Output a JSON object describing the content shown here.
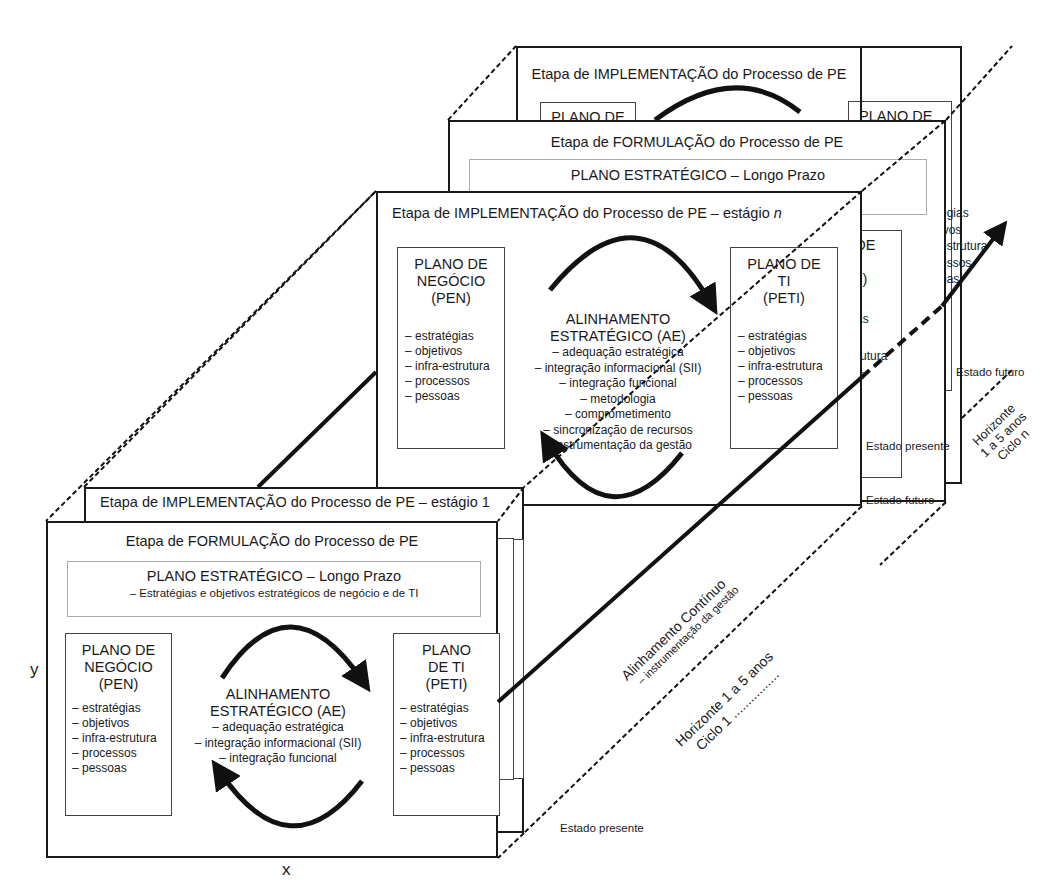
{
  "diagram": {
    "axes": {
      "x_label": "x",
      "y_label": "y"
    },
    "back_cycle": {
      "implementation": {
        "title": "Etapa de IMPLEMENTAÇÃO do Processo de PE",
        "left_plan_partial": "PLANO DE",
        "right_plan_lines": [
          "PLANO DE",
          "TI",
          "(PETI)"
        ],
        "right_list_partial": [
          "égias",
          "ivos",
          "estrutura",
          "essos",
          "oas"
        ]
      },
      "formulation": {
        "title": "Etapa de FORMULAÇÃO do Processo de PE",
        "strategic_plan_title": "PLANO ESTRATÉGICO – Longo Prazo",
        "right_plan_partial": [
          "O DE",
          "TI",
          "ETI)"
        ],
        "right_list_partial": [
          "égias",
          "vos",
          "estrutura",
          "ssos",
          "as"
        ]
      },
      "label_future": "Estado futuro",
      "label_present": "Estado presente",
      "horizon_lines": [
        "Horizonte",
        "1 a 5 anos",
        "Ciclo n"
      ]
    },
    "stage_n": {
      "title": "Etapa de IMPLEMENTAÇÃO do Processo de PE – estágio",
      "title_italic": "n",
      "left_plan": {
        "lines": [
          "PLANO DE",
          "NEGÓCIO",
          "(PEN)"
        ],
        "items": [
          "– estratégias",
          "– objetivos",
          "– infra-estrutura",
          "– processos",
          "– pessoas"
        ]
      },
      "center": {
        "lines": [
          "ALINHAMENTO",
          "ESTRATÉGICO (AE)"
        ],
        "items": [
          "– adequação estratégica",
          "– integração informacional (SII)",
          "– integração funcional",
          "– metodologia",
          "– comprometimento",
          "– sincronização de recursos",
          "– instrumentação da gestão"
        ]
      },
      "right_plan": {
        "lines": [
          "PLANO DE",
          "TI",
          "(PETI)"
        ],
        "items": [
          "– estratégias",
          "– objetivos",
          "– infra-estrutura",
          "– processos",
          "– pessoas"
        ]
      },
      "label_present": "Estado presente",
      "label_future": "Estado futuro"
    },
    "stage_1": {
      "implementation_title": "Etapa de IMPLEMENTAÇÃO do Processo de PE – estágio 1",
      "formulation_title": "Etapa de FORMULAÇÃO do Processo de PE",
      "strategic_plan": {
        "title": "PLANO ESTRATÉGICO – Longo Prazo",
        "subtitle": "– Estratégias e objetivos estratégicos de negócio e de TI"
      },
      "left_plan": {
        "lines": [
          "PLANO DE",
          "NEGÓCIO",
          "(PEN)"
        ],
        "items": [
          "– estratégias",
          "– objetivos",
          "– infra-estrutura",
          "– processos",
          "– pessoas"
        ]
      },
      "center": {
        "lines": [
          "ALINHAMENTO",
          "ESTRATÉGICO (AE)"
        ],
        "items": [
          "– adequação estratégica",
          "– integração informacional (SII)",
          "– integração funcional"
        ]
      },
      "right_plan": {
        "lines": [
          "PLANO",
          "DE TI",
          "(PETI)"
        ],
        "items": [
          "– estratégias",
          "– objetivos",
          "– infra-estrutura",
          "– processos",
          "– pessoas"
        ]
      },
      "label_present": "Estado presente"
    },
    "continuous_alignment": {
      "title": "Alinhamento Contínuo",
      "subtitle": "– instrumentação da gestão"
    },
    "horizon_cycle_1": {
      "line1": "Horizonte 1 a 5 anos",
      "line2": "Ciclo 1 ................"
    }
  }
}
